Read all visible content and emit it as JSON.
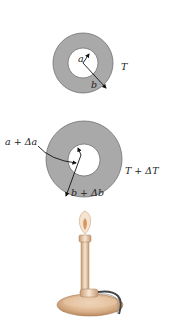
{
  "figure": {
    "ring_initial": {
      "inner_radius_label": "a",
      "outer_radius_label": "b",
      "temperature_label": "T"
    },
    "ring_heated": {
      "inner_radius_label": "a + Δa",
      "outer_radius_label": "b + Δb",
      "temperature_label": "T + ΔT"
    },
    "heat_source": "bunsen-burner"
  },
  "colors": {
    "ring_fill": "#a9a9a9",
    "ring_stroke": "#555555",
    "burner_metal": "#d9b48f",
    "flame": "#e8c9a0"
  }
}
